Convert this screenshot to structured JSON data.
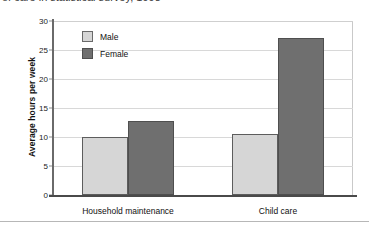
{
  "title": {
    "text": "of care in statistical survey, 1998",
    "clipped": true
  },
  "legend": {
    "position": "top-left-inside",
    "entries": [
      {
        "label": "Male",
        "color": "#d6d6d6"
      },
      {
        "label": "Female",
        "color": "#6f6f6f"
      }
    ]
  },
  "axes": {
    "ylabel": "Average hours per week",
    "yticks": [
      "0",
      "5",
      "10",
      "15",
      "20",
      "25",
      "30"
    ],
    "xlabel": ""
  },
  "chart_data": {
    "type": "bar",
    "title": "of care in statistical survey, 1998",
    "xlabel": "",
    "ylabel": "Average hours per week",
    "categories": [
      "Household maintenance",
      "Child care"
    ],
    "series": [
      {
        "name": "Male",
        "color": "#d6d6d6",
        "values": [
          10.0,
          10.5
        ]
      },
      {
        "name": "Female",
        "color": "#6f6f6f",
        "values": [
          12.8,
          27.0
        ]
      }
    ],
    "ylim": [
      0,
      30
    ],
    "ytick_step": 5,
    "grid": true,
    "legend_position": "upper left"
  }
}
